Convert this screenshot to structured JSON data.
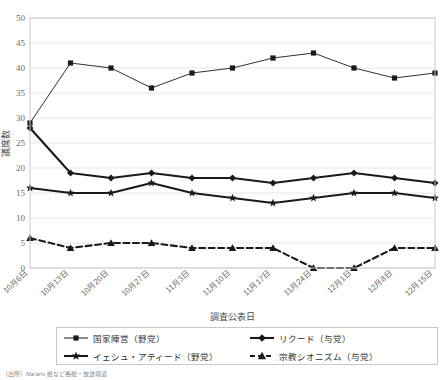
{
  "chart_data": {
    "type": "line",
    "title": "",
    "xlabel": "調査公表日",
    "ylabel": "議席数",
    "ylim": [
      0,
      50
    ],
    "yticks": [
      0,
      5,
      10,
      15,
      20,
      25,
      30,
      35,
      40,
      45,
      50
    ],
    "grid": true,
    "legend_position": "bottom",
    "categories": [
      "10月6日",
      "10月13日",
      "10月20日",
      "10月27日",
      "11月3日",
      "11月10日",
      "11月17日",
      "11月24日",
      "12月1日",
      "12月8日",
      "12月15日"
    ],
    "series": [
      {
        "name": "国家陣営（野党）",
        "short_name": "国家陣営",
        "bloc": "野党",
        "marker": "square",
        "line_style": "solid",
        "line_weight": "thin",
        "color": "#1a1a1a",
        "values": [
          29,
          41,
          40,
          36,
          39,
          40,
          42,
          43,
          40,
          38,
          39
        ]
      },
      {
        "name": "リクード（与党）",
        "short_name": "リクード",
        "bloc": "与党",
        "marker": "diamond",
        "line_style": "solid",
        "line_weight": "thick",
        "color": "#1a1a1a",
        "values": [
          28,
          19,
          18,
          19,
          18,
          18,
          17,
          18,
          19,
          18,
          17
        ]
      },
      {
        "name": "イェシュ・アティード（野党）",
        "short_name": "イェシュ・アティード",
        "bloc": "野党",
        "marker": "star",
        "line_style": "solid",
        "line_weight": "thick",
        "color": "#1a1a1a",
        "values": [
          16,
          15,
          15,
          17,
          15,
          14,
          13,
          14,
          15,
          15,
          14
        ]
      },
      {
        "name": "宗教シオニズム（与党）",
        "short_name": "宗教シオニズム",
        "bloc": "与党",
        "marker": "triangle",
        "line_style": "dashed",
        "line_weight": "thick",
        "color": "#1a1a1a",
        "values": [
          6,
          4,
          5,
          5,
          4,
          4,
          4,
          0,
          0,
          4,
          4
        ]
      }
    ]
  },
  "axes": {
    "y_title": "議席数",
    "x_title": "調査公表日"
  },
  "legend": {
    "items": [
      {
        "label": "国家陣営（野党）"
      },
      {
        "label": "リクード（与党）"
      },
      {
        "label": "イェシュ・アティード（野党）"
      },
      {
        "label": "宗教シオニズム（与党）"
      }
    ]
  },
  "footer": {
    "source": "（出所）Ma'ariv 紙など各紙・放送報道"
  },
  "colors": {
    "ink": "#1a1a1a",
    "grid": "#e6e6e6",
    "frame": "#c9c9c9",
    "tick_text": "#6b6b6b"
  }
}
